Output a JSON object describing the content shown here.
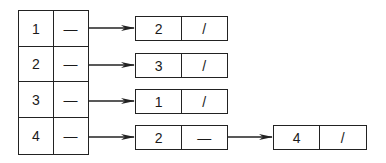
{
  "diagram": {
    "type": "adjacency-list",
    "head_array": [
      {
        "index": "1",
        "pointer": "—"
      },
      {
        "index": "2",
        "pointer": "—"
      },
      {
        "index": "3",
        "pointer": "—"
      },
      {
        "index": "4",
        "pointer": "—"
      }
    ],
    "lists": [
      [
        {
          "value": "2",
          "next": "/"
        }
      ],
      [
        {
          "value": "3",
          "next": "/"
        }
      ],
      [
        {
          "value": "1",
          "next": "/"
        }
      ],
      [
        {
          "value": "2",
          "next": "—"
        },
        {
          "value": "4",
          "next": "/"
        }
      ]
    ],
    "colors": {
      "line": "#222222",
      "background": "#ffffff"
    }
  }
}
